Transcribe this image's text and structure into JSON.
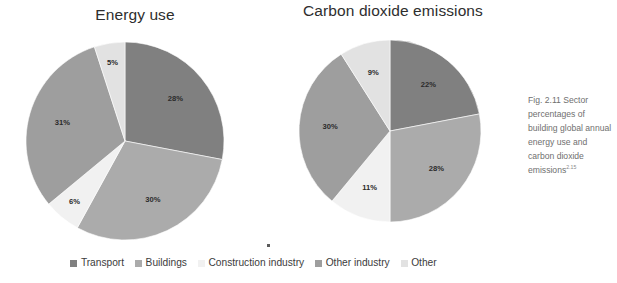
{
  "figure": {
    "caption_text": "Fig. 2.11 Sector percentages of building global annual energy use and carbon dioxide emissions",
    "caption_superscript": "2.15"
  },
  "legend": {
    "items": [
      {
        "label": "Transport",
        "color": "#808080"
      },
      {
        "label": "Buildings",
        "color": "#ababab"
      },
      {
        "label": "Construction industry",
        "color": "#f1f1f1"
      },
      {
        "label": "Other industry",
        "color": "#9e9e9e"
      },
      {
        "label": "Other",
        "color": "#e2e2e2"
      }
    ]
  },
  "chart_data": [
    {
      "type": "pie",
      "title": "Energy use",
      "categories": [
        "Transport",
        "Buildings",
        "Construction industry",
        "Other industry",
        "Other"
      ],
      "values": [
        28,
        30,
        6,
        31,
        5
      ],
      "labels": [
        "28%",
        "30%",
        "6%",
        "31%",
        "5%"
      ],
      "colors": [
        "#808080",
        "#ababab",
        "#f1f1f1",
        "#9e9e9e",
        "#e2e2e2"
      ],
      "units": "percent",
      "start_angle_deg": 0,
      "direction": "clockwise",
      "legend_position": "bottom",
      "grid": false,
      "geometry": {
        "cx": 117,
        "cy": 118,
        "r": 99,
        "label_r_frac": 0.66
      }
    },
    {
      "type": "pie",
      "title": "Carbon dioxide emissions",
      "categories": [
        "Transport",
        "Buildings",
        "Construction industry",
        "Other industry",
        "Other"
      ],
      "values": [
        22,
        28,
        11,
        30,
        9
      ],
      "labels": [
        "22%",
        "28%",
        "11%",
        "30%",
        "9%"
      ],
      "colors": [
        "#808080",
        "#ababab",
        "#f1f1f1",
        "#9e9e9e",
        "#e2e2e2"
      ],
      "units": "percent",
      "start_angle_deg": 0,
      "direction": "clockwise",
      "legend_position": "bottom",
      "grid": false,
      "geometry": {
        "cx": 118,
        "cy": 112,
        "r": 91,
        "label_r_frac": 0.66
      }
    }
  ]
}
